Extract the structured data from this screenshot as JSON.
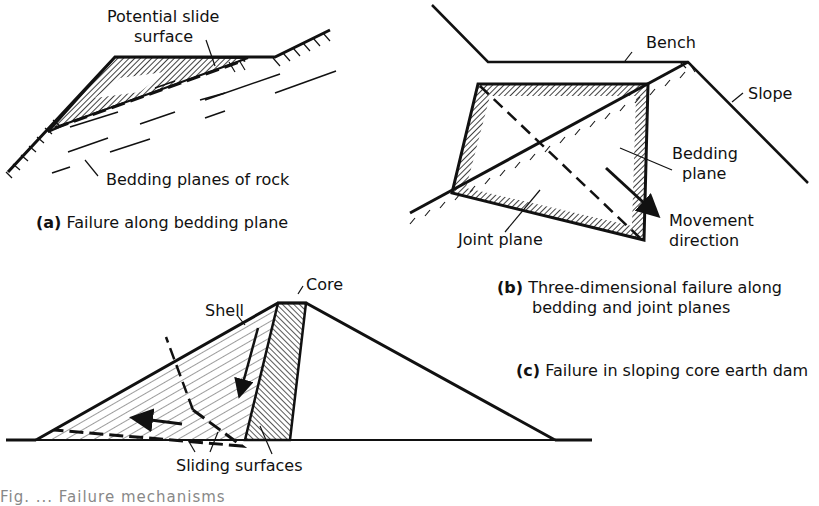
{
  "figure": {
    "panels": [
      {
        "id": "a",
        "caption_letter": "(a)",
        "caption_text": "Failure along bedding plane",
        "labels": {
          "slide_surface_line1": "Potential slide",
          "slide_surface_line2": "surface",
          "bedding_planes": "Bedding planes of rock"
        }
      },
      {
        "id": "b",
        "caption_letter": "(b)",
        "caption_line1": "Three-dimensional failure along",
        "caption_line2": "bedding and joint planes",
        "labels": {
          "bench": "Bench",
          "slope": "Slope",
          "bedding_plane_line1": "Bedding",
          "bedding_plane_line2": "plane",
          "joint_plane": "Joint plane",
          "movement_line1": "Movement",
          "movement_line2": "direction"
        }
      },
      {
        "id": "c",
        "caption_letter": "(c)",
        "caption_text": "Failure in sloping core earth dam",
        "labels": {
          "core": "Core",
          "shell": "Shell",
          "sliding_surfaces": "Sliding surfaces"
        }
      }
    ],
    "figure_caption_partial": "Fig. ... Failure mechanisms"
  }
}
